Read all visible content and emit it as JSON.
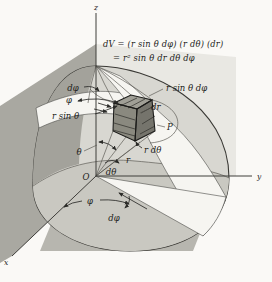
{
  "figure": {
    "formula": {
      "line1": "dV = (r sin θ dφ) (r dθ) (dr)",
      "line2": "= r² sin θ dr dθ dφ"
    },
    "axes": {
      "z": "z",
      "y": "y",
      "x": "x",
      "origin": "O"
    },
    "labels": {
      "d_phi_top": "dφ",
      "phi_top": "φ",
      "r_sin_theta": "r sin θ",
      "r_sin_theta_d_phi": "r sin θ dφ",
      "dr": "dr",
      "point": "P",
      "theta": "θ",
      "r": "r",
      "d_theta": "dθ",
      "r_d_theta": "r dθ",
      "phi_bottom": "φ",
      "d_phi_bottom": "dφ"
    },
    "colors": {
      "page": "#faf9f6",
      "backdrop": "#e9e8e3",
      "wall": "#a9a8a1",
      "floor": "#b7b6af",
      "dome": "#d8d7d1",
      "dome_dark": "#a3a29b",
      "base_disk": "#c9c8c1",
      "highlight": "#f6f5f1",
      "cube_top": "#a09f96",
      "cube_front": "#8a897f",
      "cube_right": "#75746c",
      "ink": "#1c1c1a"
    }
  }
}
